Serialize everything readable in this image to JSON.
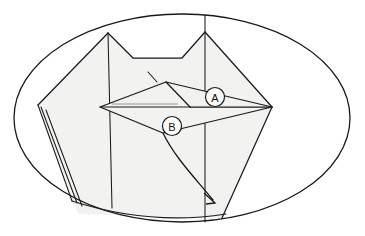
{
  "figure": {
    "background_color": "#ffffff",
    "ink_color": "#1a1a1a",
    "paper_fill_color": "#f2f2f0",
    "faint_crease_color": "#8d8d8d"
  },
  "frame": {
    "shape": "ellipse",
    "center_x": 182,
    "center_y": 118,
    "radius_x": 168,
    "radius_y": 104
  },
  "labels": [
    {
      "id": "A",
      "text": "A",
      "circle_x": 215,
      "circle_y": 97,
      "circle_r": 9.5
    },
    {
      "id": "B",
      "text": "B",
      "circle_x": 172,
      "circle_y": 126,
      "circle_r": 9.5
    }
  ],
  "arrow": {
    "name": "fold-arrow",
    "from_x": 163,
    "from_y": 133,
    "to_x": 215,
    "to_y": 203,
    "style": "curved-solid-with-open-head",
    "direction": "down-right"
  },
  "geometry": {
    "body_outline": "M 108 33 L 133 58 L 182 58 L 205 32 L 272 107 L 222 218 L 78 214 L 38 105 Z",
    "top_left_peak": [
      108,
      33
    ],
    "top_right_peak": [
      205,
      32
    ],
    "notch_left": [
      133,
      58
    ],
    "notch_right": [
      182,
      58
    ],
    "left_corner": [
      38,
      105
    ],
    "right_corner": [
      272,
      107
    ],
    "bottom_left": [
      78,
      214
    ],
    "bottom_right": [
      222,
      218
    ],
    "kite_apex": [
      166,
      82
    ],
    "kite_left": [
      100,
      107
    ],
    "kite_right": [
      272,
      107
    ],
    "kite_bottom": [
      163,
      133
    ],
    "inner_triangle_right": [
      190,
      107
    ],
    "vertical_crease_left_x": 108,
    "vertical_crease_right_x": 205
  }
}
